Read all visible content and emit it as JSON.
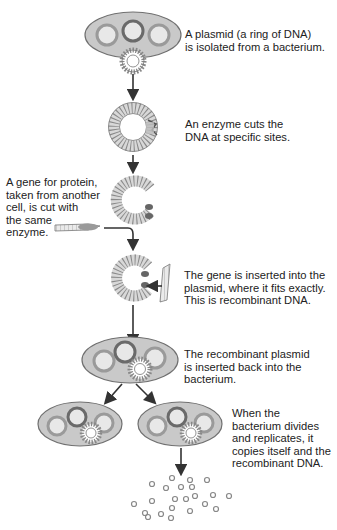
{
  "figure": {
    "colors": {
      "cell_fill": "#c9c9c9",
      "cell_stroke": "#707070",
      "plasmid_dark": "#6a6a6a",
      "plasmid_light": "#9a9a9a",
      "dna_ring": "#d8d8d8",
      "arrow": "#333333",
      "text": "#222222"
    },
    "steps": [
      {
        "id": "isolate",
        "text": "A plasmid (a ring of DNA)\nis isolated from a bacterium."
      },
      {
        "id": "cut",
        "text": "An enzyme cuts the\nDNA at specific sites."
      },
      {
        "id": "gene",
        "text": "A gene for protein,\ntaken from another\ncell, is cut with\nthe same\nenzyme."
      },
      {
        "id": "insert",
        "text": "The gene is inserted into the\nplasmid, where it fits exactly.\nThis is recombinant DNA."
      },
      {
        "id": "reinsert",
        "text": "The recombinant plasmid\nis inserted back into the\nbacterium."
      },
      {
        "id": "replicate",
        "text": "When the\nbacterium divides\nand replicates, it\ncopies itself and the\nrecombinant DNA."
      }
    ],
    "caption": "The ... (text cut off at bottom edge)"
  }
}
